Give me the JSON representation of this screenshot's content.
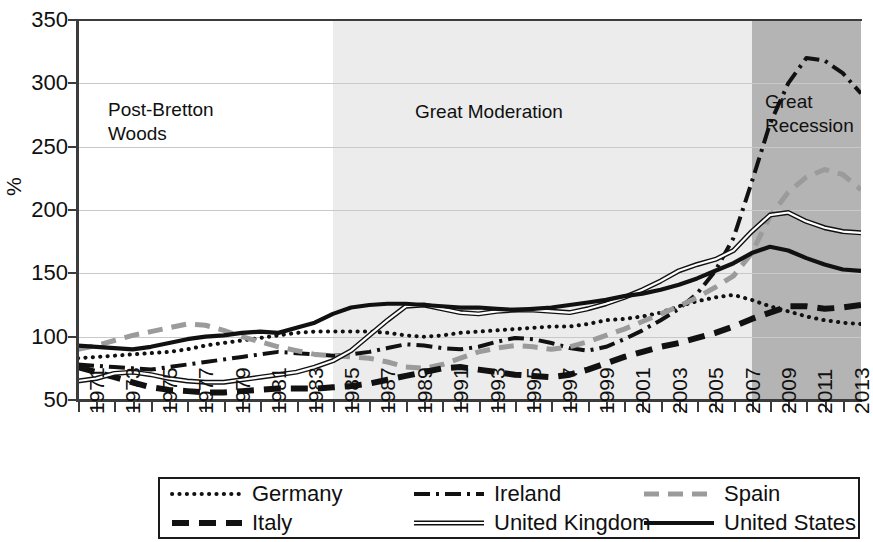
{
  "chart_data": {
    "type": "line",
    "title": "",
    "xlabel": "",
    "ylabel": "%",
    "ylim": [
      50,
      350
    ],
    "yticks": [
      50,
      100,
      150,
      200,
      250,
      300,
      350
    ],
    "xlim": [
      1971,
      2014
    ],
    "xticks": [
      1971,
      1973,
      1975,
      1977,
      1979,
      1981,
      1983,
      1985,
      1987,
      1989,
      1991,
      1993,
      1995,
      1997,
      1999,
      2001,
      2003,
      2005,
      2007,
      2009,
      2011,
      2013
    ],
    "grid": true,
    "legend_position": "bottom",
    "x": [
      1971,
      1972,
      1973,
      1974,
      1975,
      1976,
      1977,
      1978,
      1979,
      1980,
      1981,
      1982,
      1983,
      1984,
      1985,
      1986,
      1987,
      1988,
      1989,
      1990,
      1991,
      1992,
      1993,
      1994,
      1995,
      1996,
      1997,
      1998,
      1999,
      2000,
      2001,
      2002,
      2003,
      2004,
      2005,
      2006,
      2007,
      2008,
      2009,
      2010,
      2011,
      2012,
      2013,
      2014
    ],
    "series": [
      {
        "name": "Germany",
        "style": "dotted",
        "color": "#111111",
        "values": [
          83,
          84,
          85,
          86,
          87,
          88,
          90,
          93,
          95,
          97,
          99,
          101,
          103,
          104,
          104,
          104,
          104,
          103,
          101,
          100,
          101,
          103,
          104,
          105,
          106,
          107,
          108,
          108,
          110,
          113,
          114,
          116,
          119,
          124,
          128,
          131,
          133,
          129,
          124,
          120,
          116,
          113,
          111,
          110
        ]
      },
      {
        "name": "Ireland",
        "style": "dash-dot",
        "color": "#111111",
        "values": [
          78,
          77,
          76,
          75,
          74,
          76,
          78,
          80,
          82,
          84,
          86,
          88,
          87,
          86,
          85,
          86,
          88,
          91,
          94,
          93,
          91,
          90,
          92,
          96,
          99,
          98,
          95,
          91,
          89,
          92,
          98,
          105,
          113,
          122,
          134,
          152,
          178,
          222,
          268,
          300,
          320,
          318,
          308,
          292
        ]
      },
      {
        "name": "Spain",
        "style": "dashed-gray",
        "color": "#9b9b9b",
        "values": [
          90,
          93,
          97,
          101,
          104,
          107,
          110,
          109,
          105,
          100,
          96,
          92,
          89,
          86,
          85,
          84,
          83,
          80,
          76,
          75,
          78,
          83,
          88,
          91,
          93,
          92,
          90,
          92,
          96,
          101,
          106,
          112,
          118,
          124,
          131,
          139,
          148,
          166,
          195,
          214,
          226,
          232,
          228,
          216
        ]
      },
      {
        "name": "Italy",
        "style": "dashed-bold",
        "color": "#111111",
        "values": [
          76,
          72,
          68,
          64,
          60,
          58,
          57,
          56,
          56,
          57,
          58,
          59,
          59,
          59,
          60,
          61,
          63,
          66,
          69,
          72,
          75,
          76,
          74,
          72,
          70,
          69,
          68,
          70,
          74,
          79,
          84,
          88,
          92,
          95,
          99,
          103,
          108,
          114,
          119,
          124,
          124,
          122,
          123,
          125
        ]
      },
      {
        "name": "United Kingdom",
        "style": "double",
        "color": "#111111",
        "values": [
          65,
          67,
          71,
          72,
          70,
          67,
          65,
          64,
          64,
          66,
          68,
          70,
          72,
          76,
          81,
          89,
          101,
          113,
          124,
          125,
          122,
          119,
          118,
          120,
          121,
          121,
          120,
          119,
          122,
          126,
          131,
          137,
          144,
          152,
          157,
          161,
          168,
          183,
          196,
          198,
          191,
          186,
          183,
          182
        ]
      },
      {
        "name": "United States",
        "style": "solid-bold",
        "color": "#111111",
        "values": [
          93,
          92,
          91,
          90,
          92,
          95,
          98,
          100,
          101,
          103,
          104,
          103,
          107,
          111,
          118,
          123,
          125,
          126,
          126,
          125,
          124,
          123,
          123,
          122,
          121,
          122,
          123,
          125,
          127,
          129,
          132,
          134,
          137,
          141,
          146,
          152,
          158,
          166,
          171,
          168,
          162,
          157,
          153,
          152
        ]
      }
    ],
    "regions": [
      {
        "label": "Post-Bretton\nWoods",
        "start": 1971,
        "end": 1985,
        "shade": "#ffffff"
      },
      {
        "label": "Great Moderation",
        "start": 1985,
        "end": 2008,
        "shade": "#ececec"
      },
      {
        "label": "Great\nRecession",
        "start": 2008,
        "end": 2014,
        "shade": "#b4b4b4"
      }
    ]
  },
  "legend": {
    "entries": [
      {
        "label": "Germany",
        "style": "dotted"
      },
      {
        "label": "Ireland",
        "style": "dash-dot"
      },
      {
        "label": "Spain",
        "style": "dashed-gray"
      },
      {
        "label": "Italy",
        "style": "dashed-bold"
      },
      {
        "label": "United Kingdom",
        "style": "double"
      },
      {
        "label": "United States",
        "style": "solid-bold"
      }
    ]
  }
}
